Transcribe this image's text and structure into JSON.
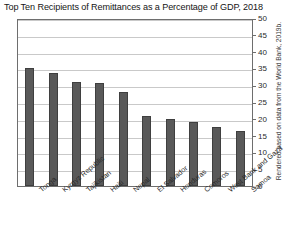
{
  "chart_data": {
    "type": "bar",
    "title": "Top Ten Recipients of Remittances as a Percentage of GDP, 2018",
    "xlabel": "",
    "ylabel": "",
    "ylim": [
      0,
      50
    ],
    "yticks": [
      0,
      5,
      10,
      15,
      20,
      25,
      30,
      35,
      40,
      45,
      50
    ],
    "grid": true,
    "y_axis_position": "right",
    "legend": "none",
    "categories": [
      "Tonga",
      "Kyrgyz Republic",
      "Tajikistan",
      "Haiti",
      "Nepal",
      "El Salvador",
      "Honduras",
      "Comoros",
      "West Bank and Gaza",
      "Samoa"
    ],
    "values": [
      35.2,
      33.6,
      31.0,
      30.7,
      28.0,
      20.9,
      20.0,
      19.1,
      17.7,
      16.3
    ],
    "bar_color": "#595959",
    "bar_edge_color": "#3f3f3f",
    "gridline_color": "#c9c9c9",
    "frame_color": "#6e6e6e",
    "source_note": "Rendered based on data from the World Bank, 2019b."
  }
}
